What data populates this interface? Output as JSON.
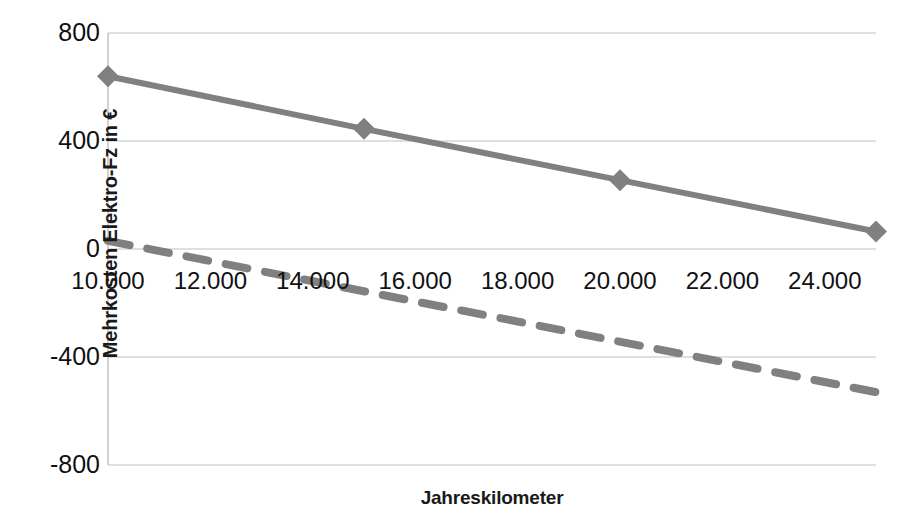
{
  "chart_data": {
    "type": "line",
    "title": "",
    "xlabel": "Jahreskilometer",
    "ylabel": "Mehrkosten Elektro-Fz in €",
    "xlim": [
      10000,
      25000
    ],
    "ylim": [
      -800,
      800
    ],
    "grid": true,
    "legend": "none",
    "x_ticks": [
      {
        "value": 10000,
        "label": "10.000"
      },
      {
        "value": 12000,
        "label": "12.000"
      },
      {
        "value": 14000,
        "label": "14.000"
      },
      {
        "value": 16000,
        "label": "16.000"
      },
      {
        "value": 18000,
        "label": "18.000"
      },
      {
        "value": 20000,
        "label": "20.000"
      },
      {
        "value": 22000,
        "label": "22.000"
      },
      {
        "value": 24000,
        "label": "24.000"
      }
    ],
    "y_ticks": [
      {
        "value": 800,
        "label": "800"
      },
      {
        "value": 400,
        "label": "400"
      },
      {
        "value": 0,
        "label": "0"
      },
      {
        "value": -400,
        "label": "-400"
      },
      {
        "value": -800,
        "label": "-800"
      }
    ],
    "series": [
      {
        "name": "series-solid",
        "style": "solid",
        "color": "#808080",
        "marker": "diamond",
        "x": [
          10000,
          15000,
          20000,
          25000
        ],
        "values": [
          640,
          445,
          255,
          65
        ]
      },
      {
        "name": "series-dashed",
        "style": "dashed",
        "color": "#808080",
        "marker": "none",
        "x": [
          10000,
          25000
        ],
        "values": [
          30,
          -530
        ]
      }
    ]
  },
  "axes": {
    "y_title": "Mehrkosten Elektro-Fz in €",
    "x_title": "Jahreskilometer"
  },
  "colors": {
    "series": "#808080",
    "grid": "#bfbfbf",
    "text": "#111111",
    "background": "#ffffff"
  }
}
